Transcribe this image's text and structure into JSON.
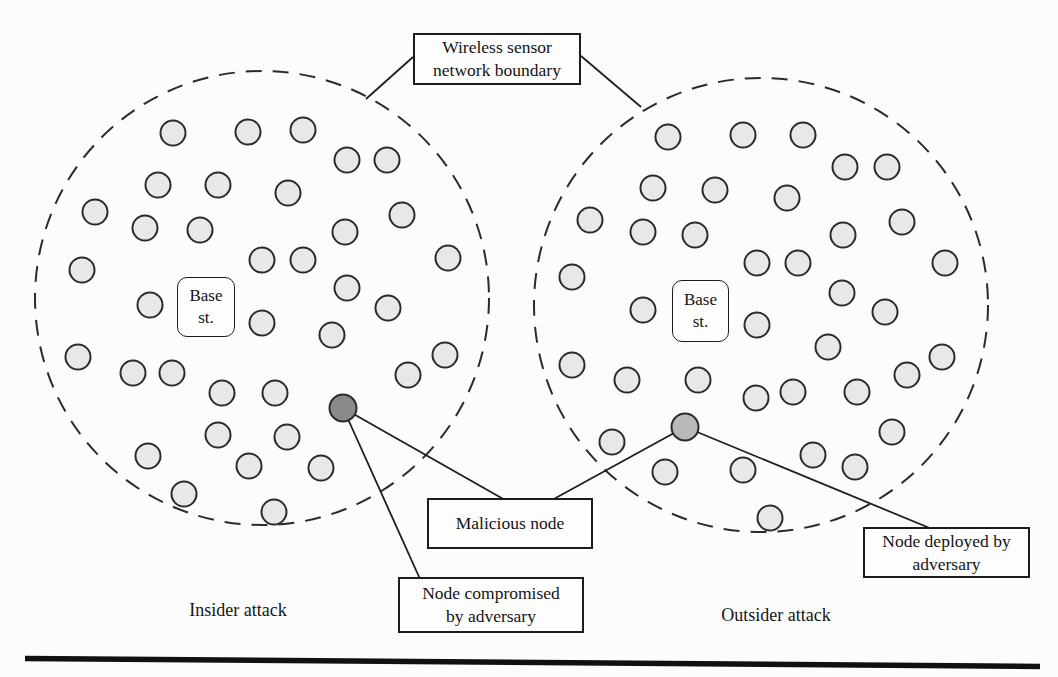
{
  "figure": {
    "boundary_label": "Wireless sensor\nnetwork boundary",
    "base_station_label": "Base\nst.",
    "malicious_node_label": "Malicious node",
    "compromised_label": "Node compromised\nby adversary",
    "deployed_label": "Node deployed by\nadversary",
    "insider_caption": "Insider attack",
    "outsider_caption": "Outsider attack"
  },
  "colors": {
    "background": "#fcfcfc",
    "node_fill": "#e8e8e8",
    "node_stroke": "#2b2b2b",
    "compromised_node_fill": "#8a8a8a",
    "deployed_node_fill": "#b9b9b9",
    "line": "#1e1e1e",
    "rule": "#111111"
  },
  "geometry": {
    "canvas": [
      1058,
      677
    ],
    "node_radius": 12.5,
    "malicious_node_radius": 13.5,
    "boundaries": [
      {
        "cx": 262,
        "cy": 298,
        "r": 227
      },
      {
        "cx": 761,
        "cy": 305,
        "r": 227
      }
    ],
    "left_nodes": [
      [
        173,
        133
      ],
      [
        248,
        132
      ],
      [
        303,
        130
      ],
      [
        347,
        160
      ],
      [
        387,
        160
      ],
      [
        158,
        185
      ],
      [
        218,
        185
      ],
      [
        288,
        193
      ],
      [
        95,
        212
      ],
      [
        402,
        215
      ],
      [
        145,
        228
      ],
      [
        200,
        230
      ],
      [
        345,
        232
      ],
      [
        262,
        260
      ],
      [
        303,
        260
      ],
      [
        448,
        258
      ],
      [
        82,
        270
      ],
      [
        347,
        288
      ],
      [
        150,
        305
      ],
      [
        388,
        308
      ],
      [
        262,
        323
      ],
      [
        332,
        335
      ],
      [
        445,
        355
      ],
      [
        78,
        357
      ],
      [
        133,
        373
      ],
      [
        172,
        373
      ],
      [
        408,
        375
      ],
      [
        222,
        393
      ],
      [
        275,
        393
      ],
      [
        218,
        435
      ],
      [
        287,
        437
      ],
      [
        148,
        456
      ],
      [
        249,
        466
      ],
      [
        321,
        468
      ],
      [
        184,
        494
      ],
      [
        274,
        512
      ]
    ],
    "right_nodes": [
      [
        668,
        137
      ],
      [
        743,
        135
      ],
      [
        803,
        135
      ],
      [
        845,
        167
      ],
      [
        887,
        167
      ],
      [
        653,
        188
      ],
      [
        715,
        190
      ],
      [
        787,
        198
      ],
      [
        590,
        220
      ],
      [
        902,
        222
      ],
      [
        643,
        232
      ],
      [
        695,
        235
      ],
      [
        843,
        235
      ],
      [
        757,
        263
      ],
      [
        798,
        263
      ],
      [
        945,
        263
      ],
      [
        572,
        277
      ],
      [
        842,
        293
      ],
      [
        643,
        310
      ],
      [
        885,
        312
      ],
      [
        757,
        325
      ],
      [
        828,
        347
      ],
      [
        942,
        357
      ],
      [
        572,
        365
      ],
      [
        627,
        380
      ],
      [
        698,
        380
      ],
      [
        907,
        375
      ],
      [
        756,
        398
      ],
      [
        793,
        392
      ],
      [
        857,
        392
      ],
      [
        612,
        442
      ],
      [
        892,
        432
      ],
      [
        665,
        472
      ],
      [
        743,
        470
      ],
      [
        813,
        455
      ],
      [
        855,
        467
      ],
      [
        770,
        518
      ]
    ],
    "compromised_node": [
      343,
      408
    ],
    "deployed_node": [
      685,
      427
    ],
    "leader_lines": [
      [
        413,
        57,
        366,
        99
      ],
      [
        581,
        56,
        641,
        107
      ],
      [
        343,
        408,
        505,
        500
      ],
      [
        343,
        408,
        420,
        579
      ],
      [
        685,
        427,
        552,
        500
      ],
      [
        685,
        427,
        932,
        529
      ]
    ],
    "bottom_rule": [
      25,
      658.5,
      1040,
      666.5
    ]
  }
}
